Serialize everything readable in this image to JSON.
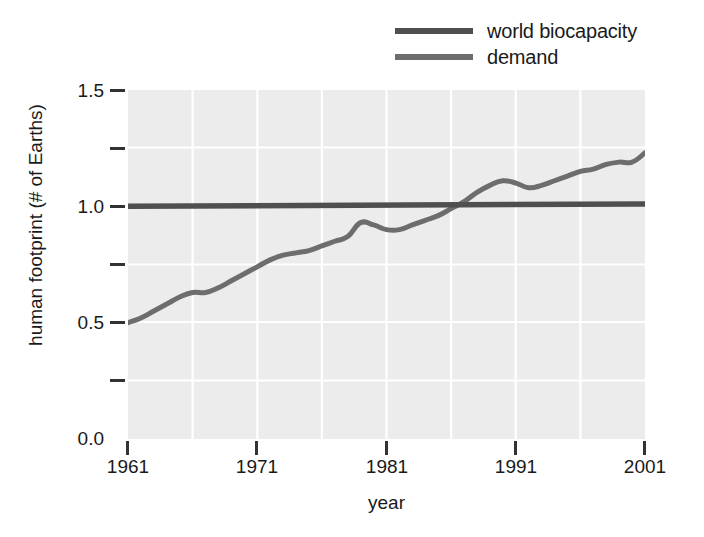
{
  "chart_data": {
    "type": "line",
    "title": "",
    "xlabel": "year",
    "ylabel": "human footprint (# of Earths)",
    "xlim": [
      1961,
      2001
    ],
    "ylim": [
      0.0,
      1.5
    ],
    "grid": true,
    "legend_position": "top-right",
    "xticks": [
      1961,
      1971,
      1981,
      1991,
      2001
    ],
    "xtick_labels": [
      "1961",
      "1971",
      "1981",
      "1991",
      "2001"
    ],
    "yticks": [
      0.0,
      0.25,
      0.5,
      0.75,
      1.0,
      1.25,
      1.5
    ],
    "ytick_labels": [
      "0.0",
      "",
      "0.5",
      "",
      "1.0",
      "",
      "1.5"
    ],
    "ytick_labeled": [
      0.0,
      0.5,
      1.0,
      1.5
    ],
    "ytick_minor": [
      0.25,
      0.75,
      1.25
    ],
    "series": [
      {
        "name": "world biocapacity",
        "color": "#4f4f4f",
        "x": [
          1961,
          2001
        ],
        "values": [
          1.0,
          1.01
        ]
      },
      {
        "name": "demand",
        "color": "#6d6d6d",
        "x": [
          1961,
          1962,
          1963,
          1964,
          1965,
          1966,
          1967,
          1968,
          1969,
          1970,
          1971,
          1972,
          1973,
          1974,
          1975,
          1976,
          1977,
          1978,
          1979,
          1980,
          1981,
          1982,
          1983,
          1984,
          1985,
          1986,
          1987,
          1988,
          1989,
          1990,
          1991,
          1992,
          1993,
          1994,
          1995,
          1996,
          1997,
          1998,
          1999,
          2000,
          2001
        ],
        "values": [
          0.5,
          0.52,
          0.55,
          0.58,
          0.61,
          0.63,
          0.63,
          0.65,
          0.68,
          0.71,
          0.74,
          0.77,
          0.79,
          0.8,
          0.81,
          0.83,
          0.85,
          0.87,
          0.93,
          0.92,
          0.9,
          0.9,
          0.92,
          0.94,
          0.96,
          0.99,
          1.02,
          1.06,
          1.09,
          1.11,
          1.1,
          1.08,
          1.09,
          1.11,
          1.13,
          1.15,
          1.16,
          1.18,
          1.19,
          1.19,
          1.23
        ]
      }
    ]
  },
  "legend": {
    "items": [
      {
        "label": "world biocapacity",
        "swatch_class": "biocap"
      },
      {
        "label": "demand",
        "swatch_class": "demand"
      }
    ]
  },
  "axes": {
    "x_title": "year",
    "y_title": "human footprint (# of Earths)",
    "x_tick_1": "1961",
    "x_tick_2": "1971",
    "x_tick_3": "1981",
    "x_tick_4": "1991",
    "x_tick_5": "2001",
    "y_tick_1": "0.0",
    "y_tick_2": "0.5",
    "y_tick_3": "1.0",
    "y_tick_4": "1.5"
  },
  "colors": {
    "plot_background": "#ececec",
    "grid": "#ffffff",
    "biocapacity_line": "#4f4f4f",
    "demand_line": "#6d6d6d",
    "text": "#1a1a1a",
    "page_background": "#ffffff"
  }
}
